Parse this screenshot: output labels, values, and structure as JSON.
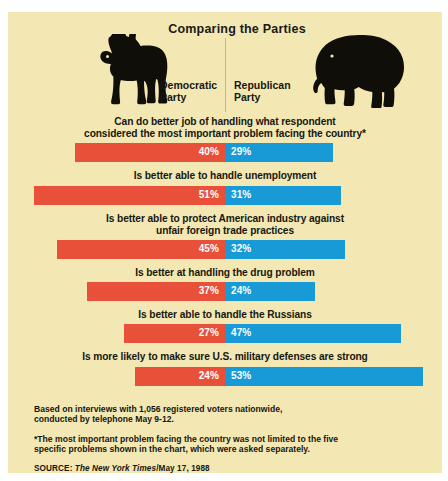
{
  "panel": {
    "background_color": "#f3e7b4"
  },
  "header": {
    "title": "Comparing the Parties",
    "democratic_label": "Democratic\nParty",
    "democratic_label_line1": "Democratic",
    "democratic_label_line2": "Party",
    "republican_label_line1": "Republican",
    "republican_label_line2": "Party",
    "donkey_icon": "donkey-silhouette",
    "elephant_icon": "elephant-silhouette"
  },
  "colors": {
    "democratic": "#e8503a",
    "republican": "#189ad6",
    "background": "#f3e7b4",
    "text": "#17170f"
  },
  "footer": {
    "note1_line1": "Based on interviews with 1,056 registered voters nationwide,",
    "note1_line2": "conducted by telephone May 9-12.",
    "note2_line1": "*The most important problem facing the country was not limited to the five",
    "note2_line2": "specific problems shown in the chart, which were asked separately.",
    "source_prefix": "SOURCE: ",
    "source_paper": "The New York Times",
    "source_suffix": "/May 17, 1988"
  },
  "chart_data": {
    "type": "bar",
    "title": "Comparing the Parties",
    "subtitle": "",
    "xlabel": "",
    "ylabel": "",
    "orientation": "horizontal-diverging",
    "unit": "percent",
    "px_per_percent": 3.74,
    "center_px": 217,
    "legend": [
      "Democratic Party",
      "Republican Party"
    ],
    "legend_position": "top",
    "grid": false,
    "categories": [
      "Can do better job of handling what respondent considered the most important problem facing the country*",
      "Is better able to handle unemployment",
      "Is better able to protect American industry against unfair foreign trade practices",
      "Is better at handling the drug problem",
      "Is better able to handle the Russians",
      "Is more likely to make sure U.S. military defenses are strong"
    ],
    "category_lines": [
      [
        "Can do better job of handling what respondent",
        "considered the most important problem facing the country*"
      ],
      [
        "Is better able to handle unemployment"
      ],
      [
        "Is better able to protect American industry against",
        "unfair foreign trade practices"
      ],
      [
        "Is better at handling the drug problem"
      ],
      [
        "Is better able to handle the Russians"
      ],
      [
        "Is more likely to make sure U.S. military defenses are strong"
      ]
    ],
    "series": [
      {
        "name": "Democratic Party",
        "color": "#e8503a",
        "values": [
          40,
          51,
          45,
          37,
          27,
          24
        ],
        "labels": [
          "40%",
          "51%",
          "45%",
          "37%",
          "27%",
          "24%"
        ]
      },
      {
        "name": "Republican Party",
        "color": "#189ad6",
        "values": [
          29,
          31,
          32,
          24,
          47,
          53
        ],
        "labels": [
          "29%",
          "31%",
          "32%",
          "24%",
          "47%",
          "53%"
        ]
      }
    ],
    "xlim": [
      0,
      60
    ],
    "notes": [
      "Based on interviews with 1,056 registered voters nationwide, conducted by telephone May 9-12.",
      "*The most important problem facing the country was not limited to the five specific problems shown in the chart, which were asked separately."
    ],
    "source": "SOURCE: The New York Times/May 17, 1988"
  }
}
